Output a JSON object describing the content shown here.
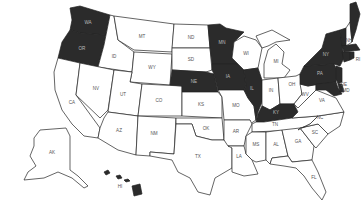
{
  "map": {
    "title": "United States",
    "legend": {
      "highlighted_color": "#2b2b2b",
      "default_color": "#ffffff",
      "border_color": "#222222"
    },
    "highlighted_states": [
      "WA",
      "OR",
      "NE",
      "IA",
      "MN",
      "IL",
      "KY",
      "NY",
      "PA",
      "NJ",
      "MD",
      "DE",
      "ME",
      "VT",
      "MA",
      "CT",
      "RI",
      "HI"
    ],
    "labels": {
      "WA": "WA",
      "OR": "OR",
      "CA": "CA",
      "ID": "ID",
      "NV": "NV",
      "MT": "MT",
      "WY": "WY",
      "UT": "UT",
      "AZ": "AZ",
      "CO": "CO",
      "NM": "NM",
      "ND": "ND",
      "SD": "SD",
      "NE": "NE",
      "KS": "KS",
      "OK": "OK",
      "TX": "TX",
      "MN": "MN",
      "IA": "IA",
      "MO": "MO",
      "AR": "AR",
      "LA": "LA",
      "WI": "WI",
      "IL": "IL",
      "MI": "MI",
      "IN": "IN",
      "OH": "OH",
      "KY": "KY",
      "TN": "TN",
      "MS": "MS",
      "AL": "AL",
      "GA": "GA",
      "FL": "FL",
      "SC": "SC",
      "NC": "NC",
      "VA": "VA",
      "WV": "WV",
      "PA": "PA",
      "NY": "NY",
      "NH": "NH",
      "RI": "RI",
      "DE": "DE",
      "MD": "MD",
      "AK": "AK",
      "HI": "HI"
    }
  }
}
